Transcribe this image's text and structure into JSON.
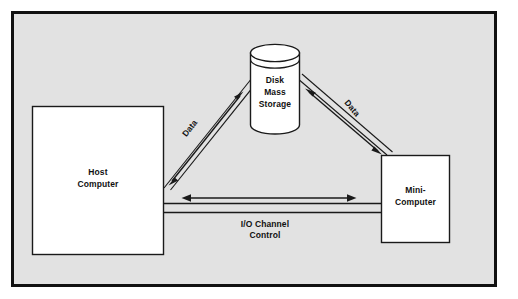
{
  "figure": {
    "type": "block-diagram",
    "background_color": "#ffffff",
    "frame_fill": "#e2e2e2",
    "frame_stroke": "#111111",
    "shape_fill": "#ffffff",
    "shape_stroke": "#1a1a1a",
    "text_color": "#111111"
  },
  "nodes": {
    "host": {
      "name": "host-computer",
      "shape": "rectangle",
      "line1": "Host",
      "line2": "Computer"
    },
    "storage": {
      "name": "disk-mass-storage",
      "shape": "cylinder",
      "line1": "Disk",
      "line2": "Mass",
      "line3": "Storage"
    },
    "mini": {
      "name": "mini-computer",
      "shape": "rectangle",
      "line1": "Mini-",
      "line2": "Computer"
    }
  },
  "edges": {
    "host_storage": {
      "name": "host-to-storage-data-path",
      "label": "Data",
      "arrow": "bidirectional"
    },
    "storage_mini": {
      "name": "storage-to-mini-data-path",
      "label": "Data",
      "arrow": "bidirectional"
    },
    "host_mini": {
      "name": "io-channel-control-path",
      "label_line1": "I/O Channel",
      "label_line2": "Control",
      "arrow": "bidirectional"
    }
  }
}
